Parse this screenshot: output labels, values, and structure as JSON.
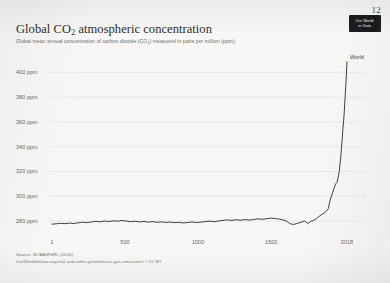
{
  "page": {
    "number": "12",
    "background_color": "#f7f7f5"
  },
  "logo": {
    "name": "our-world-in-data-logo",
    "line1": "Our World",
    "line2": "in Data",
    "background_color": "#1b1b1b",
    "text_color": "#f2f2f2"
  },
  "header": {
    "title_prefix": "Global CO",
    "title_sub": "2",
    "title_suffix": " atmospheric concentration",
    "subtitle_prefix": "Global mean annual concentration of carbon dioxide (CO",
    "subtitle_sub": "2",
    "subtitle_suffix": ") measured in parts per million (ppm)."
  },
  "footer": {
    "source": "Source: NOAA/ESRL (2016)",
    "license": "OurWorldInData.org/co2-and-other-greenhouse-gas-emissions/ • CC BY"
  },
  "chart_data": {
    "type": "line",
    "title": "Global CO2 atmospheric concentration",
    "subtitle": "Global mean annual concentration of carbon dioxide (CO2) measured in parts per million (ppm).",
    "xlabel": "",
    "ylabel": "",
    "units": "ppm",
    "grid": "horizontal",
    "legend_position": "line-end",
    "line_color": "#1f1f1d",
    "grid_color": "#e0e0dc",
    "xlim": [
      1,
      2018
    ],
    "ylim": [
      272,
      410
    ],
    "xticks": [
      1,
      500,
      1000,
      1500,
      2018
    ],
    "xtick_labels": [
      "1",
      "500",
      "1000",
      "1500",
      "2018"
    ],
    "yticks": [
      280,
      300,
      320,
      340,
      360,
      380,
      400
    ],
    "ytick_labels": [
      "280 ppm",
      "300 ppm",
      "320 ppm",
      "340 ppm",
      "360 ppm",
      "380 ppm",
      "400 ppm"
    ],
    "series": [
      {
        "name": "World",
        "label": "World",
        "x": [
          1,
          30,
          60,
          90,
          120,
          150,
          180,
          210,
          240,
          270,
          300,
          330,
          360,
          390,
          420,
          450,
          480,
          510,
          540,
          570,
          600,
          630,
          660,
          690,
          720,
          750,
          780,
          810,
          840,
          870,
          900,
          930,
          960,
          990,
          1020,
          1050,
          1080,
          1110,
          1140,
          1170,
          1200,
          1230,
          1260,
          1290,
          1320,
          1350,
          1380,
          1410,
          1440,
          1470,
          1500,
          1530,
          1560,
          1580,
          1600,
          1610,
          1620,
          1630,
          1650,
          1670,
          1690,
          1710,
          1730,
          1750,
          1770,
          1790,
          1800,
          1810,
          1820,
          1830,
          1840,
          1850,
          1860,
          1870,
          1880,
          1890,
          1900,
          1910,
          1920,
          1930,
          1940,
          1950,
          1955,
          1960,
          1965,
          1970,
          1975,
          1980,
          1985,
          1990,
          1995,
          2000,
          2005,
          2010,
          2014,
          2016,
          2018
        ],
        "y": [
          277.5,
          277.8,
          278.2,
          277.9,
          278.4,
          278.0,
          278.6,
          279.1,
          278.7,
          279.3,
          279.8,
          279.4,
          280.1,
          279.6,
          280.3,
          279.9,
          280.5,
          280.0,
          279.5,
          279.9,
          279.3,
          279.7,
          279.1,
          279.6,
          279.0,
          279.4,
          278.9,
          279.2,
          278.7,
          279.0,
          278.5,
          278.9,
          279.3,
          278.8,
          279.2,
          279.6,
          280.0,
          279.5,
          280.1,
          280.6,
          281.0,
          280.5,
          281.1,
          280.7,
          281.2,
          280.8,
          281.3,
          281.8,
          281.4,
          282.0,
          282.4,
          282.0,
          281.5,
          281.0,
          280.2,
          279.4,
          278.6,
          277.9,
          277.3,
          277.8,
          278.6,
          279.4,
          280.0,
          278.0,
          279.8,
          280.6,
          281.2,
          282.0,
          283.1,
          284.0,
          285.0,
          285.6,
          286.3,
          287.2,
          288.4,
          290.0,
          295.7,
          299.6,
          303.0,
          306.5,
          310.0,
          311.3,
          314.0,
          316.9,
          320.0,
          325.7,
          331.1,
          338.7,
          346.0,
          354.4,
          360.8,
          369.5,
          379.8,
          389.9,
          398.6,
          404.2,
          408.5
        ]
      }
    ],
    "annotation": {
      "text": "World",
      "at_x": 2018,
      "at_y": 408.5
    }
  }
}
